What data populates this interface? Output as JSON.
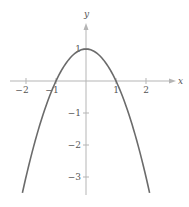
{
  "chart_data": {
    "type": "line",
    "title": "",
    "function": "y = 1 - x^2",
    "xlabel": "x",
    "ylabel": "y",
    "xlim": [
      -2.3,
      2.6
    ],
    "ylim": [
      -3.5,
      1.8
    ],
    "x_ticks": [
      -2,
      -1,
      1,
      2
    ],
    "x_tick_labels": [
      "−2",
      "−1",
      "1",
      "2"
    ],
    "y_ticks": [
      1,
      -1,
      -2,
      -3
    ],
    "y_tick_labels": [
      "1",
      "−1",
      "−2",
      "−3"
    ],
    "grid": false,
    "legend": null,
    "series": [
      {
        "name": "y = 1 - x^2",
        "x": [
          -2.12,
          -2,
          -1.5,
          -1,
          -0.5,
          0,
          0.5,
          1,
          1.5,
          2,
          2.12
        ],
        "y": [
          -3.5,
          -3,
          -1.25,
          0,
          0.75,
          1,
          0.75,
          0,
          -1.25,
          -3,
          -3.5
        ]
      }
    ],
    "colors": {
      "curve": "#6b6b6b",
      "axes": "#b5b5b5",
      "text": "#555555"
    }
  }
}
